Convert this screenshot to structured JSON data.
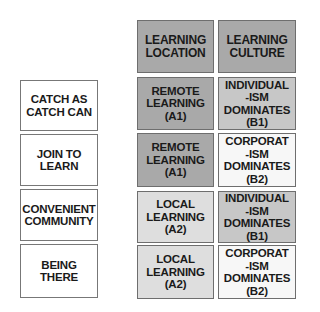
{
  "headers": {
    "location": "LEARNING\nLOCATION",
    "culture": "LEARNING\nCULTURE"
  },
  "rows": [
    {
      "label": "CATCH AS\nCATCH CAN",
      "location": "REMOTE\nLEARNING\n(A1)",
      "culture": "INDIVIDUAL\n-ISM\nDOMINATES\n(B1)"
    },
    {
      "label": "JOIN TO\nLEARN",
      "location": "REMOTE\nLEARNING\n(A1)",
      "culture": "CORPORAT\n-ISM\nDOMINATES\n(B2)"
    },
    {
      "label": "CONVENIENT\nCOMMUNITY",
      "location": "LOCAL\nLEARNING\n(A2)",
      "culture": "INDIVIDUAL\n-ISM\nDOMINATES\n(B1)"
    },
    {
      "label": "BEING\nTHERE",
      "location": "LOCAL\nLEARNING\n(A2)",
      "culture": "CORPORAT\n-ISM\nDOMINATES\n(B2)"
    }
  ],
  "colors": {
    "header": "#a9a9a9",
    "remote": "#a9a9a9",
    "local": "#dedede",
    "individualism": "#c7c7c7",
    "corporatism": "#f7f7f7"
  }
}
